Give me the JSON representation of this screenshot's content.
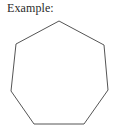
{
  "figure": {
    "caption": "Example:",
    "background_color": "#ffffff",
    "text_color": "#2b2b2b"
  },
  "shape": {
    "name": "heptagon",
    "sides": 7,
    "stroke_color": "#555555",
    "fill_color": "#ffffff",
    "stroke_width": 1,
    "points": "59,21 104,45 108,90 84,124 34,124 11,91 16,44",
    "vertices": [
      {
        "label": "top",
        "x": 59,
        "y": 21
      },
      {
        "label": "upper-right",
        "x": 104,
        "y": 45
      },
      {
        "label": "lower-right",
        "x": 108,
        "y": 90
      },
      {
        "label": "bottom-right",
        "x": 84,
        "y": 124
      },
      {
        "label": "bottom-left",
        "x": 34,
        "y": 124
      },
      {
        "label": "lower-left",
        "x": 11,
        "y": 91
      },
      {
        "label": "upper-left",
        "x": 16,
        "y": 44
      }
    ]
  }
}
